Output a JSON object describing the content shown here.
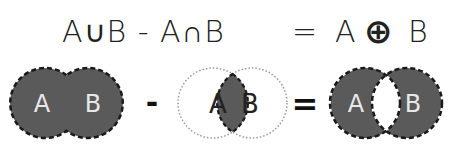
{
  "formula": {
    "lhs": "A∪B - A∩B",
    "equals": "=",
    "rhs_a": "A",
    "rhs_op": "⊕",
    "rhs_b": "B"
  },
  "diagram": {
    "union": {
      "label_a": "A",
      "label_b": "B"
    },
    "minus": "-",
    "intersection": {
      "label_a": "A",
      "label_b": "B"
    },
    "equals": "=",
    "symmetric_difference": {
      "label_a": "A",
      "label_b": "B"
    },
    "colors": {
      "fill": "#5a5a5a",
      "outline": "#1a1a1a",
      "dotted": "#999999",
      "label_light": "#e8e8e8",
      "label_dark": "#222222"
    }
  }
}
